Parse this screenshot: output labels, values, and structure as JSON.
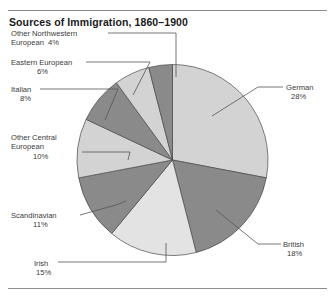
{
  "chart_data": {
    "type": "pie",
    "title": "Sources of Immigration, 1860–1900",
    "xlabel": "",
    "ylabel": "",
    "legend_position": "none",
    "grid": false,
    "units": "percent",
    "categories": [
      "German",
      "British",
      "Irish",
      "Scandinavian",
      "Other Central European",
      "Italian",
      "Eastern European",
      "Other Northwestern European"
    ],
    "values": [
      28,
      18,
      15,
      11,
      10,
      8,
      6,
      4
    ],
    "slices": [
      {
        "name": "German",
        "label": "German",
        "percent_text": "28%",
        "value": 28,
        "fill": "#d3d3d3",
        "start_deg": 0,
        "end_deg": 100.8,
        "label_lines": [
          "German"
        ]
      },
      {
        "name": "British",
        "label": "British",
        "percent_text": "18%",
        "value": 18,
        "fill": "#8a8a8a",
        "start_deg": 100.8,
        "end_deg": 165.6,
        "label_lines": [
          "British"
        ]
      },
      {
        "name": "Irish",
        "label": "Irish",
        "percent_text": "15%",
        "value": 15,
        "fill": "#e3e3e3",
        "start_deg": 165.6,
        "end_deg": 219.6,
        "label_lines": [
          "Irish"
        ]
      },
      {
        "name": "Scandinavian",
        "label": "Scandinavian",
        "percent_text": "11%",
        "value": 11,
        "fill": "#8a8a8a",
        "start_deg": 219.6,
        "end_deg": 259.2,
        "label_lines": [
          "Scandinavian"
        ]
      },
      {
        "name": "Other Central European",
        "label": "Other Central European",
        "percent_text": "10%",
        "value": 10,
        "fill": "#d3d3d3",
        "start_deg": 259.2,
        "end_deg": 295.2,
        "label_lines": [
          "Other Central",
          "European"
        ]
      },
      {
        "name": "Italian",
        "label": "Italian",
        "percent_text": "8%",
        "value": 8,
        "fill": "#8a8a8a",
        "start_deg": 295.2,
        "end_deg": 324.0,
        "label_lines": [
          "Italian"
        ]
      },
      {
        "name": "Eastern European",
        "label": "Eastern European",
        "percent_text": "6%",
        "value": 6,
        "fill": "#d3d3d3",
        "start_deg": 324.0,
        "end_deg": 345.6,
        "label_lines": [
          "Eastern European"
        ]
      },
      {
        "name": "Other Northwestern European",
        "label": "Other Northwestern European",
        "percent_text": "4%",
        "value": 4,
        "fill": "#8a8a8a",
        "start_deg": 345.6,
        "end_deg": 360.0,
        "label_lines": [
          "Other Northwestern",
          "European"
        ]
      }
    ]
  },
  "labels": {
    "northwestern": {
      "line1": "Other Northwestern",
      "line2": "European",
      "pct": "4%"
    },
    "eastern": {
      "line1": "Eastern European",
      "pct": "6%"
    },
    "italian": {
      "line1": "Italian",
      "pct": "8%"
    },
    "central": {
      "line1": "Other Central",
      "line2": "European",
      "pct": "10%"
    },
    "scandinavian": {
      "line1": "Scandinavian",
      "pct": "11%"
    },
    "irish": {
      "line1": "Irish",
      "pct": "15%"
    },
    "german": {
      "line1": "German",
      "pct": "28%"
    },
    "british": {
      "line1": "British",
      "pct": "18%"
    }
  },
  "colors": {
    "light_slice": "#d3d3d3",
    "lighter_slice": "#e3e3e3",
    "dark_slice": "#8a8a8a",
    "outline": "#4a4a4a",
    "leader_line": "#555555",
    "rule": "#8d8d8d",
    "text": "#3a3a3a",
    "background": "#ffffff"
  }
}
